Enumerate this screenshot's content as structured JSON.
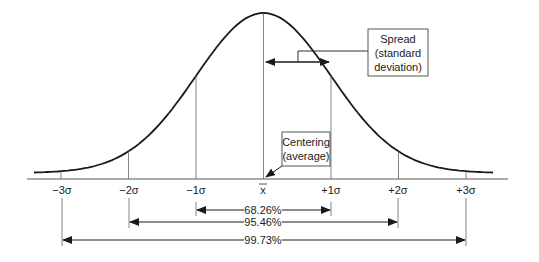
{
  "chart_data": {
    "type": "line",
    "title": "",
    "subtitle": "",
    "xlabel": "",
    "ylabel": "",
    "grid": false,
    "legend": null,
    "x_ticks": [
      {
        "label": "−3σ",
        "sigma": -3
      },
      {
        "label": "−2σ",
        "sigma": -2
      },
      {
        "label": "−1σ",
        "sigma": -1
      },
      {
        "label": "x̅",
        "sigma": 0
      },
      {
        "label": "+1σ",
        "sigma": 1
      },
      {
        "label": "+2σ",
        "sigma": 2
      },
      {
        "label": "+3σ",
        "sigma": 3
      }
    ],
    "x_range_sigma": [
      -3.4,
      3.4
    ],
    "coverage_intervals": [
      {
        "label": "68.26%",
        "from": -1,
        "to": 1
      },
      {
        "label": "95.46%",
        "from": -2,
        "to": 2
      },
      {
        "label": "99.73%",
        "from": -3,
        "to": 3
      }
    ],
    "annotations": [
      {
        "label": "Spread (standard deviation)",
        "lines": [
          "Spread",
          "(standard",
          "deviation)"
        ],
        "target": "arrow from mean to +1σ"
      },
      {
        "label": "Centering (average)",
        "lines": [
          "Centering",
          "(average)"
        ],
        "target": "mean x̅"
      }
    ]
  },
  "labels": {
    "ticks": [
      "−3σ",
      "−2σ",
      "−1σ",
      "x",
      "+1σ",
      "+2σ",
      "+3σ"
    ],
    "pct_1": "68.26%",
    "pct_2": "95.46%",
    "pct_3": "99.73%",
    "spread": [
      "Spread",
      "(standard",
      "deviation)"
    ],
    "centering": [
      "Centering",
      "(average)"
    ]
  },
  "colors": {
    "line": "#1a1a1a",
    "thin": "#555555",
    "background": "#ffffff"
  }
}
